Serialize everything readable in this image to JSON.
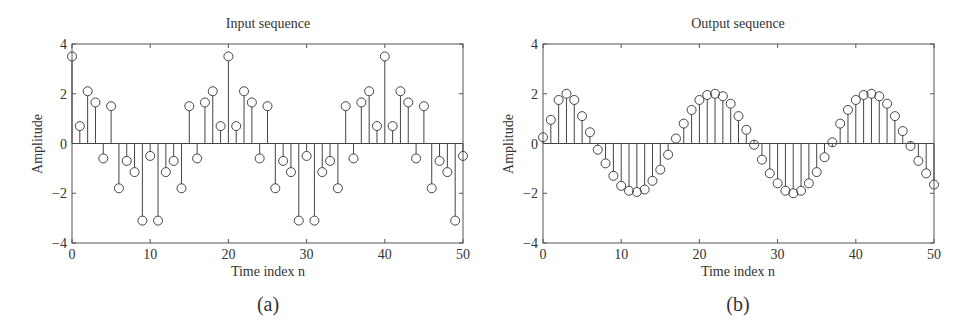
{
  "figure": {
    "panels": [
      {
        "id": "a",
        "caption": "(a)",
        "title": "Input sequence",
        "xlabel": "Time index n",
        "ylabel": "Amplitude"
      },
      {
        "id": "b",
        "caption": "(b)",
        "title": "Output sequence",
        "xlabel": "Time index n",
        "ylabel": "Amplitude"
      }
    ],
    "colors": {
      "axis": "#555555",
      "stem": "#444444",
      "marker": "#444444",
      "text": "#333333",
      "background": "#ffffff"
    }
  },
  "chart_data": [
    {
      "type": "stem",
      "title": "Input sequence",
      "xlabel": "Time index n",
      "ylabel": "Amplitude",
      "xlim": [
        0,
        50
      ],
      "ylim": [
        -4,
        4
      ],
      "xticks": [
        0,
        10,
        20,
        30,
        40,
        50
      ],
      "yticks": [
        -4,
        -2,
        0,
        2,
        4
      ],
      "grid": false,
      "marker": "open-circle",
      "x": [
        0,
        1,
        2,
        3,
        4,
        5,
        6,
        7,
        8,
        9,
        10,
        11,
        12,
        13,
        14,
        15,
        16,
        17,
        18,
        19,
        20,
        21,
        22,
        23,
        24,
        25,
        26,
        27,
        28,
        29,
        30,
        31,
        32,
        33,
        34,
        35,
        36,
        37,
        38,
        39,
        40,
        41,
        42,
        43,
        44,
        45,
        46,
        47,
        48,
        49,
        50
      ],
      "values": [
        3.5,
        0.7,
        2.1,
        1.65,
        -0.6,
        1.5,
        -1.8,
        -0.7,
        -1.15,
        -3.1,
        -0.5,
        -3.1,
        -1.15,
        -0.7,
        -1.8,
        1.5,
        -0.6,
        1.65,
        2.1,
        0.7,
        3.5,
        0.7,
        2.1,
        1.65,
        -0.6,
        1.5,
        -1.8,
        -0.7,
        -1.15,
        -3.1,
        -0.5,
        -3.1,
        -1.15,
        -0.7,
        -1.8,
        1.5,
        -0.6,
        1.65,
        2.1,
        0.7,
        3.5,
        0.7,
        2.1,
        1.65,
        -0.6,
        1.5,
        -1.8,
        -0.7,
        -1.15,
        -3.1,
        -0.5
      ]
    },
    {
      "type": "stem",
      "title": "Output sequence",
      "xlabel": "Time index n",
      "ylabel": "Amplitude",
      "xlim": [
        0,
        50
      ],
      "ylim": [
        -4,
        4
      ],
      "xticks": [
        0,
        10,
        20,
        30,
        40,
        50
      ],
      "yticks": [
        -4,
        -2,
        0,
        2,
        4
      ],
      "grid": false,
      "marker": "open-circle",
      "x": [
        0,
        1,
        2,
        3,
        4,
        5,
        6,
        7,
        8,
        9,
        10,
        11,
        12,
        13,
        14,
        15,
        16,
        17,
        18,
        19,
        20,
        21,
        22,
        23,
        24,
        25,
        26,
        27,
        28,
        29,
        30,
        31,
        32,
        33,
        34,
        35,
        36,
        37,
        38,
        39,
        40,
        41,
        42,
        43,
        44,
        45,
        46,
        47,
        48,
        49,
        50
      ],
      "values": [
        0.25,
        0.95,
        1.75,
        2.0,
        1.75,
        1.1,
        0.45,
        -0.25,
        -0.8,
        -1.3,
        -1.7,
        -1.9,
        -1.95,
        -1.85,
        -1.5,
        -1.05,
        -0.45,
        0.2,
        0.8,
        1.35,
        1.75,
        1.95,
        2.0,
        1.9,
        1.6,
        1.1,
        0.55,
        -0.05,
        -0.65,
        -1.2,
        -1.6,
        -1.9,
        -2.0,
        -1.9,
        -1.6,
        -1.15,
        -0.55,
        0.05,
        0.8,
        1.35,
        1.75,
        1.95,
        2.0,
        1.9,
        1.6,
        1.1,
        0.5,
        -0.1,
        -0.7,
        -1.2,
        -1.65
      ]
    }
  ]
}
